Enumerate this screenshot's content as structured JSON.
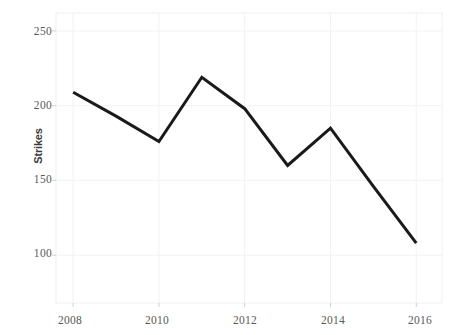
{
  "chart_data": {
    "type": "line",
    "title": "",
    "xlabel": "",
    "ylabel": "Strikes",
    "x": [
      2008,
      2009,
      2010,
      2011,
      2012,
      2013,
      2014,
      2015,
      2016
    ],
    "values": [
      209,
      193,
      176,
      219,
      198,
      160,
      185,
      146,
      108
    ],
    "series": [
      {
        "name": "Strikes",
        "values": [
          209,
          193,
          176,
          219,
          198,
          160,
          185,
          146,
          108
        ],
        "color": "#1a1a1a"
      }
    ],
    "xlim": [
      2007.6,
      2016.6
    ],
    "ylim": [
      68,
      262
    ],
    "xticks": [
      2008,
      2010,
      2012,
      2014,
      2016
    ],
    "xtick_labels": [
      "2008",
      "2010",
      "2012",
      "2014",
      "2016"
    ],
    "yticks": [
      100,
      150,
      200,
      250
    ],
    "ytick_labels": [
      "100",
      "150",
      "200",
      "250"
    ],
    "grid": true,
    "grid_color": "#f2f2f2",
    "legend": "none",
    "line_width": 3
  },
  "axes": {
    "y_title": "Strikes",
    "y_tick_0": "100",
    "y_tick_1": "150",
    "y_tick_2": "200",
    "y_tick_3": "250",
    "x_tick_0": "2008",
    "x_tick_1": "2010",
    "x_tick_2": "2012",
    "x_tick_3": "2014",
    "x_tick_4": "2016"
  },
  "header": {
    "title": ""
  }
}
